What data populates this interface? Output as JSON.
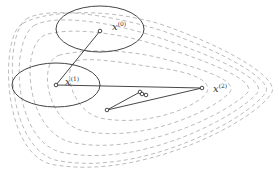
{
  "diagram": {
    "colors": {
      "contour": "#aaaaaa",
      "ellipse": "#444444",
      "path": "#333333",
      "point": "#333333"
    },
    "labels": {
      "x0": "x",
      "x0_sup": "(0)",
      "x1": "x",
      "x1_sup": "(1)",
      "x2": "x",
      "x2_sup": "(2)"
    },
    "points": [
      {
        "id": "x0",
        "x": 100,
        "y": 31
      },
      {
        "id": "x1",
        "x": 56,
        "y": 85
      },
      {
        "id": "x2",
        "x": 202,
        "y": 88
      },
      {
        "id": "p3",
        "x": 107,
        "y": 110
      },
      {
        "id": "p4",
        "x": 140,
        "y": 92
      },
      {
        "id": "p5",
        "x": 142,
        "y": 94
      },
      {
        "id": "p6",
        "x": 146,
        "y": 95
      }
    ],
    "ellipses": [
      {
        "id": "trust-region-0",
        "cx": 100,
        "cy": 29,
        "rx": 44,
        "ry": 23
      },
      {
        "id": "trust-region-1",
        "cx": 56,
        "cy": 85,
        "rx": 44,
        "ry": 22
      }
    ]
  }
}
